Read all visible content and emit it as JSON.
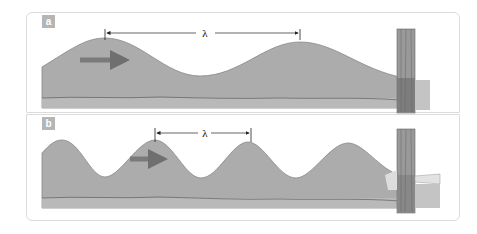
{
  "figure": {
    "panels": [
      {
        "label": "a",
        "symbol": "λ",
        "description": "long-wavelength wave moving right toward post"
      },
      {
        "label": "b",
        "symbol": "λ",
        "description": "short-wavelength wave moving right toward post"
      }
    ],
    "colors": {
      "water": "#a9a9a9",
      "ground": "#b8b8b8",
      "arrow": "#7a7a7a",
      "post": "#8c8c8c",
      "border": "#dcdcdc"
    }
  }
}
